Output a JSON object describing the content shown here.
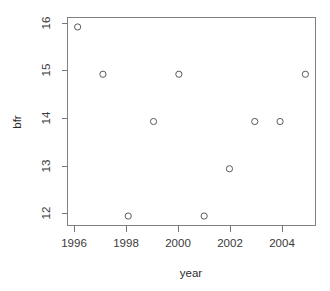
{
  "chart_data": {
    "type": "scatter",
    "title": "",
    "xlabel": "year",
    "ylabel": "bfr",
    "x": [
      1996,
      1997,
      1998,
      1999,
      2000,
      2001,
      2002,
      2003,
      2004,
      2005
    ],
    "values": [
      16,
      15,
      12,
      14,
      15,
      12,
      13,
      14,
      14,
      15
    ],
    "points": [
      {
        "x": 1996,
        "y": 16
      },
      {
        "x": 1997,
        "y": 15
      },
      {
        "x": 1998,
        "y": 12
      },
      {
        "x": 1999,
        "y": 14
      },
      {
        "x": 2000,
        "y": 15
      },
      {
        "x": 2001,
        "y": 12
      },
      {
        "x": 2002,
        "y": 13
      },
      {
        "x": 2003,
        "y": 14
      },
      {
        "x": 2004,
        "y": 14
      },
      {
        "x": 2005,
        "y": 15
      }
    ],
    "xlim": [
      1995.6,
      2005.4
    ],
    "ylim": [
      11.8,
      16.2
    ],
    "xticks": [
      1996,
      1998,
      2000,
      2002,
      2004
    ],
    "xtick_labels": [
      "1996",
      "1998",
      "2000",
      "2002",
      "2004"
    ],
    "yticks": [
      12,
      13,
      14,
      15,
      16
    ],
    "ytick_labels": [
      "12",
      "13",
      "14",
      "15",
      "16"
    ],
    "grid": false,
    "legend": null,
    "marker": "open-circle",
    "marker_color": "#5a5a5a",
    "background_color": "#ffffff",
    "axis_color": "#777777"
  }
}
